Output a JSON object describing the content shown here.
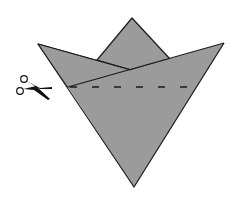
{
  "diagram": {
    "colors": {
      "paper": "#9b9b9b",
      "outline": "#1a1a1a",
      "background": "#ffffff",
      "scissors": "#111111"
    },
    "shapes": {
      "back_square_tip": {
        "top": [
          132,
          18
        ],
        "left": [
          97,
          60
        ],
        "right": [
          170,
          59
        ]
      },
      "left_flap": {
        "points": [
          [
            38,
            44
          ],
          [
            131,
            70
          ],
          [
            68,
            87
          ]
        ]
      },
      "front_triangle": {
        "points": [
          [
            68,
            87
          ],
          [
            131,
            70
          ],
          [
            224,
            43
          ],
          [
            134,
            187
          ]
        ]
      },
      "fold_line": {
        "from": [
          68,
          87
        ],
        "to": [
          224,
          43
        ]
      },
      "cut_line": {
        "style": "dashed",
        "from": [
          70,
          87
        ],
        "to": [
          196,
          87
        ]
      }
    },
    "icons": {
      "scissors": "scissors-icon"
    },
    "labels": {
      "cut_instruction": "Cut along dashed line"
    }
  }
}
